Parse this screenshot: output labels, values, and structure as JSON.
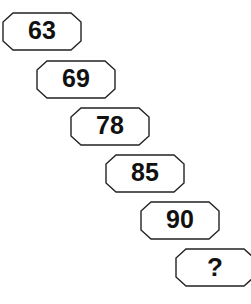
{
  "diagram": {
    "type": "number-sequence-staircase",
    "shape": "octagon",
    "background_color": "#ffffff",
    "outline_color": "#222222",
    "fill_color": "#ffffff",
    "text_color": "#111111",
    "nodes": [
      {
        "label": "63",
        "x": 2,
        "y": 12,
        "index": 1
      },
      {
        "label": "69",
        "x": 36,
        "y": 60,
        "index": 2
      },
      {
        "label": "78",
        "x": 70,
        "y": 107,
        "index": 3
      },
      {
        "label": "85",
        "x": 105,
        "y": 154,
        "index": 4
      },
      {
        "label": "90",
        "x": 140,
        "y": 201,
        "index": 5
      },
      {
        "label": "?",
        "x": 175,
        "y": 248,
        "index": 6
      }
    ]
  }
}
